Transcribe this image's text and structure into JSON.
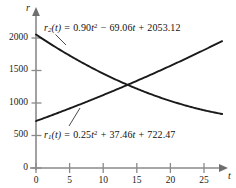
{
  "chart_data": {
    "type": "line",
    "title": "",
    "xlabel": "t",
    "ylabel": "r",
    "xlim": [
      0,
      28
    ],
    "ylim": [
      0,
      2150
    ],
    "grid": false,
    "legend": "inline-annotations",
    "x_ticks": [
      "0",
      "5",
      "10",
      "15",
      "20",
      "25"
    ],
    "x_tick_values": [
      0,
      5,
      10,
      15,
      20,
      25
    ],
    "y_ticks": [
      "0",
      "500",
      "1000",
      "1500",
      "2000"
    ],
    "y_tick_values": [
      0,
      500,
      1000,
      1500,
      2000
    ],
    "series": [
      {
        "name": "r1",
        "expression": "r1(t) = 0.25t^2 + 37.46t + 722.47",
        "coefficients": {
          "a": 0.25,
          "b": 37.46,
          "c": 722.47
        },
        "direction": "increasing",
        "x": [
          0,
          5,
          10,
          15,
          20,
          25,
          27.7
        ],
        "values": [
          722,
          916,
          1122,
          1340,
          1572,
          1816,
          1949
        ]
      },
      {
        "name": "r2",
        "expression": "r2(t) = 0.90t^2 - 69.06t + 2053.12",
        "coefficients": {
          "a": 0.9,
          "b": -69.06,
          "c": 2053.12
        },
        "direction": "decreasing",
        "x": [
          0,
          5,
          10,
          15,
          20,
          25,
          27.7
        ],
        "values": [
          2053,
          1730,
          1453,
          1219,
          1032,
          891,
          831
        ]
      }
    ],
    "intersection": {
      "t": 13.9,
      "r": 1247
    },
    "annotations": [
      {
        "id": "r2-label",
        "text_parts": {
          "fname": "r",
          "fsub": "2",
          "arg": "(t)",
          "equals": "=",
          "term1_coef": "0.90",
          "term1_var": "t",
          "term1_exp": "2",
          "op1": "−",
          "term2": "69.06",
          "term2_var": "t",
          "op2": "+",
          "term3": "2053.12"
        },
        "plain": "r2(t) = 0.90t2 − 69.06t + 2053.12"
      },
      {
        "id": "r1-label",
        "text_parts": {
          "fname": "r",
          "fsub": "1",
          "arg": "(t)",
          "equals": "=",
          "term1_coef": "0.25",
          "term1_var": "t",
          "term1_exp": "2",
          "op1": "+",
          "term2": "37.46",
          "term2_var": "t",
          "op2": "+",
          "term3": "722.47"
        },
        "plain": "r1(t) = 0.25t2 + 37.46t + 722.47"
      }
    ],
    "colors": {
      "curve": "#1a1a1a",
      "axis": "#7a7a7a",
      "text": "#111111",
      "background": "#ffffff"
    }
  },
  "axes": {
    "y_name": "r",
    "x_name": "t"
  },
  "ticks": {
    "y": [
      {
        "label": "2000",
        "y": 38
      },
      {
        "label": "1500",
        "y": 70.5
      },
      {
        "label": "1000",
        "y": 103
      },
      {
        "label": "500",
        "y": 135.5
      },
      {
        "label": "0",
        "y": 168
      }
    ],
    "x": [
      {
        "label": "0",
        "x": 36
      },
      {
        "label": "5",
        "x": 69.6
      },
      {
        "label": "10",
        "x": 103.2
      },
      {
        "label": "15",
        "x": 136.8
      },
      {
        "label": "20",
        "x": 170.4
      },
      {
        "label": "25",
        "x": 204
      }
    ]
  }
}
